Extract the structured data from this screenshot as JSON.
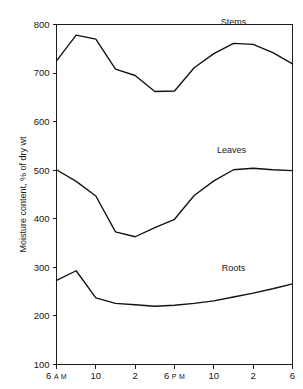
{
  "chart_data": {
    "type": "line",
    "title": "",
    "xlabel": "",
    "ylabel": "Moisture content, % of dry wt",
    "ylim": [
      100,
      800
    ],
    "yticks": [
      100,
      200,
      300,
      400,
      500,
      600,
      700,
      800
    ],
    "ytick_labels": [
      "100",
      "200",
      "300",
      "400",
      "500",
      "600",
      "700",
      "800"
    ],
    "grid": false,
    "legend_position": "inline-right",
    "x": [
      6,
      8,
      10,
      12,
      14,
      16,
      18,
      20,
      22,
      24,
      26,
      28,
      30
    ],
    "xticks": [
      6,
      10,
      14,
      18,
      22,
      26,
      30
    ],
    "xtick_labels": [
      {
        "value": "6",
        "suffix": "A M"
      },
      {
        "value": "10",
        "suffix": ""
      },
      {
        "value": "2",
        "suffix": ""
      },
      {
        "value": "6",
        "suffix": "P M"
      },
      {
        "value": "10",
        "suffix": ""
      },
      {
        "value": "2",
        "suffix": ""
      },
      {
        "value": "6",
        "suffix": ""
      }
    ],
    "series": [
      {
        "name": "Stems",
        "color": "#111111",
        "label_x": 24.0,
        "label_y": 800,
        "values": [
          725,
          778,
          770,
          708,
          695,
          662,
          663,
          711,
          740,
          761,
          759,
          742,
          719
        ]
      },
      {
        "name": "Leaves",
        "color": "#111111",
        "label_x": 23.8,
        "label_y": 536,
        "values": [
          501,
          477,
          447,
          373,
          363,
          382,
          399,
          448,
          478,
          501,
          504,
          501,
          499
        ]
      },
      {
        "name": "Roots",
        "color": "#111111",
        "label_x": 24.0,
        "label_y": 292,
        "values": [
          273,
          293,
          237,
          226,
          223,
          220,
          222,
          226,
          231,
          239,
          247,
          256,
          266
        ]
      }
    ]
  }
}
